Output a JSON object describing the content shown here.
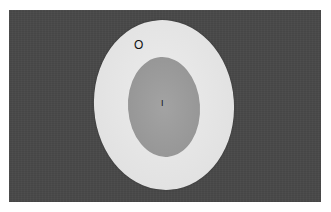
{
  "image": {
    "description": "Grayscale photograph of a white oval disc with a darker gray inner oval on a dark background",
    "colors": {
      "background": "#4a4a4a",
      "outer_oval": "#e6e6e6",
      "inner_oval": "#9a9a9a",
      "labels": "#111111"
    }
  },
  "labels": {
    "outer": "O",
    "inner": "I"
  }
}
